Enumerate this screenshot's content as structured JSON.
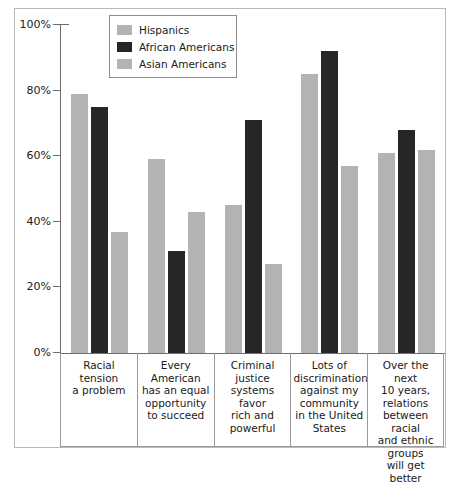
{
  "chart_data": {
    "type": "bar",
    "title": "",
    "subtitle": "",
    "xlabel": "",
    "ylabel": "",
    "ylim": [
      0,
      100
    ],
    "yticks": [
      "0%",
      "20%",
      "40%",
      "60%",
      "80%",
      "100%"
    ],
    "ytick_values": [
      0,
      20,
      40,
      60,
      80,
      100
    ],
    "grid": false,
    "legend_position": "top-left-inside",
    "categories": [
      "Racial tension\na problem",
      "Every American\nhas an equal\nopportunity\nto succeed",
      "Criminal\njustice\nsystems favor\nrich and\npowerful",
      "Lots of\ndiscrimination\nagainst my\ncommunity\nin the United\nStates",
      "Over the next\n10 years,\nrelations\nbetween racial\nand ethnic\ngroups\nwill get better"
    ],
    "series": [
      {
        "name": "Hispanics",
        "color": "#b3b3b3",
        "values": [
          79,
          59,
          45,
          85,
          61
        ]
      },
      {
        "name": "African Americans",
        "color": "#262626",
        "values": [
          75,
          31,
          71,
          92,
          68
        ]
      },
      {
        "name": "Asian Americans",
        "color": "#b3b3b3",
        "values": [
          37,
          43,
          27,
          57,
          62
        ]
      }
    ]
  },
  "legend": {
    "items": [
      {
        "label": "Hispanics"
      },
      {
        "label": "African Americans"
      },
      {
        "label": "Asian Americans"
      }
    ]
  }
}
